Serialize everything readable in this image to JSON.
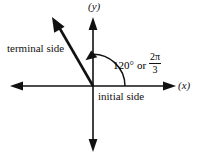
{
  "figure": {
    "background_color": "#ffffff",
    "stroke_color": "#111111",
    "axes": {
      "x_label": "(x)",
      "y_label": "(y)",
      "origin": {
        "x": 93,
        "y": 86
      },
      "x_axis_left_end": 10,
      "x_axis_right_end": 176,
      "y_axis_top_end": 17,
      "y_axis_bottom_end": 152
    },
    "labels": {
      "terminal_side": "terminal side",
      "initial_side": "initial side"
    },
    "angle": {
      "degrees_text": "120°",
      "conjunction": "or",
      "radians_numerator": "2π",
      "radians_denominator": "3",
      "value_degrees": 120,
      "arc_radius": 32,
      "arc_direction": "counterclockwise"
    },
    "terminal_ray": {
      "tip_x": 52,
      "tip_y": 17,
      "line_width": 2.6
    }
  }
}
